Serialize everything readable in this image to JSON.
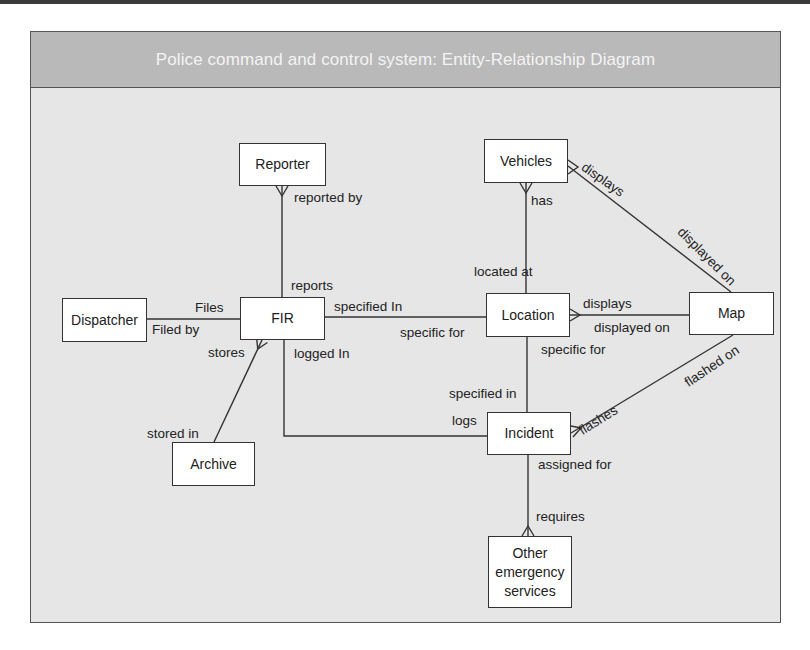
{
  "title": "Police command and control system: Entity-Relationship Diagram",
  "entities": {
    "reporter": "Reporter",
    "vehicles": "Vehicles",
    "dispatcher": "Dispatcher",
    "fir": "FIR",
    "location": "Location",
    "map": "Map",
    "archive": "Archive",
    "incident": "Incident",
    "other_services": "Other emergency services"
  },
  "relationships": [
    {
      "from": "Dispatcher",
      "to": "FIR",
      "label_from": "Files",
      "label_to": "Filed by"
    },
    {
      "from": "Reporter",
      "to": "FIR",
      "label_from": "reported by",
      "label_to": "reports"
    },
    {
      "from": "FIR",
      "to": "Location",
      "label_from": "specified In",
      "label_to": "specific for"
    },
    {
      "from": "FIR",
      "to": "Archive",
      "label_from": "stores",
      "label_to": "stored in"
    },
    {
      "from": "FIR",
      "to": "Incident",
      "label_from": "logged In",
      "label_to": "logs"
    },
    {
      "from": "Vehicles",
      "to": "Location",
      "label_from": "has",
      "label_to": "located at"
    },
    {
      "from": "Vehicles",
      "to": "Map",
      "label_from": "displays",
      "label_to": "displayed on"
    },
    {
      "from": "Location",
      "to": "Map",
      "label_from": "displays",
      "label_to": "displayed on"
    },
    {
      "from": "Location",
      "to": "Incident",
      "label_from": "specific for",
      "label_to": "specified in"
    },
    {
      "from": "Incident",
      "to": "Map",
      "label_from": "flashes",
      "label_to": "flashed on"
    },
    {
      "from": "Incident",
      "to": "Other emergency services",
      "label_from": "assigned for",
      "label_to": "requires"
    }
  ],
  "labels": {
    "files": "Files",
    "filed_by": "Filed by",
    "reported_by": "reported by",
    "reports": "reports",
    "specified_in_fir": "specified In",
    "specific_for_loc": "specific for",
    "stores": "stores",
    "stored_in": "stored in",
    "logged_in": "logged In",
    "logs": "logs",
    "has": "has",
    "located_at": "located at",
    "displays_vehicles": "displays",
    "displayed_on_vehicles": "displayed on",
    "displays_location": "displays",
    "displayed_on_location": "displayed on",
    "specific_for_incident": "specific for",
    "specified_in_incident": "specified in",
    "flashes": "flashes",
    "flashed_on": "flashed on",
    "assigned_for": "assigned for",
    "requires": "requires"
  },
  "colors": {
    "header_bg": "#b9b9b9",
    "canvas_bg": "#e6e6e6",
    "entity_bg": "#ffffff",
    "line": "#333333"
  }
}
